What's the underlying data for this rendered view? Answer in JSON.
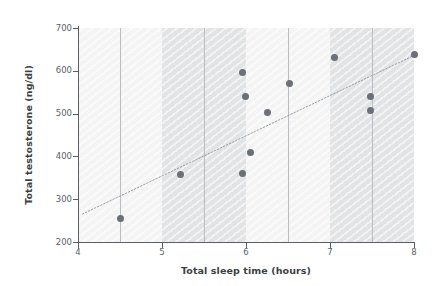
{
  "chart_data": {
    "type": "scatter",
    "title": "",
    "xlabel": "Total sleep time (hours)",
    "ylabel": "Total testosterone (ng/dl)",
    "xlim": [
      4,
      8
    ],
    "ylim": [
      200,
      700
    ],
    "xticks": [
      4,
      5,
      6,
      7,
      8
    ],
    "xtick_labels": [
      "4",
      "5",
      "6",
      "7",
      "8"
    ],
    "yticks": [
      200,
      300,
      400,
      500,
      600,
      700
    ],
    "ytick_labels": [
      "200",
      "300",
      "400",
      "500",
      "600",
      "700"
    ],
    "grid": "vertical-only",
    "gridlines_x": [
      4.5,
      5.5,
      6.5,
      7.5
    ],
    "legend": "none",
    "shaded_bands": [
      {
        "x0": 4.0,
        "x1": 5.0,
        "shade": "light"
      },
      {
        "x0": 5.0,
        "x1": 6.0,
        "shade": "dark"
      },
      {
        "x0": 6.0,
        "x1": 7.0,
        "shade": "light"
      },
      {
        "x0": 7.0,
        "x1": 8.0,
        "shade": "dark"
      }
    ],
    "points": [
      {
        "x": 4.5,
        "y": 255
      },
      {
        "x": 5.22,
        "y": 358
      },
      {
        "x": 5.96,
        "y": 360
      },
      {
        "x": 5.96,
        "y": 595
      },
      {
        "x": 5.99,
        "y": 540
      },
      {
        "x": 6.05,
        "y": 409
      },
      {
        "x": 6.25,
        "y": 502
      },
      {
        "x": 6.52,
        "y": 570
      },
      {
        "x": 7.05,
        "y": 632
      },
      {
        "x": 7.48,
        "y": 541
      },
      {
        "x": 7.48,
        "y": 507
      },
      {
        "x": 8.0,
        "y": 637
      }
    ],
    "trendline": {
      "style": "dotted",
      "x0": 4.05,
      "y0": 265,
      "x1": 8.0,
      "y1": 636
    },
    "colors": {
      "point": "#6b7078",
      "trendline": "#9aa0a8",
      "band_dark": "#e2e3e5",
      "band_light": "#f4f4f5",
      "gridline": "#b9bcc1",
      "axis": "#5a5f66",
      "axis_title": "#3b3f44",
      "tick_label": "#5a5f66",
      "background": "#ffffff"
    }
  }
}
